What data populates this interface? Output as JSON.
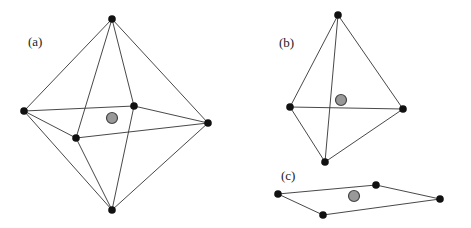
{
  "figure": {
    "panels": [
      {
        "label": "(a)",
        "shape": "octahedron",
        "label_pos": [
          28,
          46
        ],
        "vertices": [
          [
            112,
            19
          ],
          [
            24,
            111
          ],
          [
            134,
            106
          ],
          [
            208,
            123
          ],
          [
            76,
            138
          ],
          [
            112,
            210
          ]
        ],
        "edges": [
          [
            0,
            1
          ],
          [
            0,
            2
          ],
          [
            0,
            3
          ],
          [
            0,
            4
          ],
          [
            5,
            1
          ],
          [
            5,
            2
          ],
          [
            5,
            3
          ],
          [
            5,
            4
          ],
          [
            1,
            2
          ],
          [
            2,
            3
          ],
          [
            3,
            4
          ],
          [
            4,
            1
          ]
        ],
        "center": [
          112,
          118
        ]
      },
      {
        "label": "(b)",
        "shape": "tetrahedron",
        "label_pos": [
          279,
          47
        ],
        "vertices": [
          [
            338,
            15
          ],
          [
            290,
            107
          ],
          [
            403,
            109
          ],
          [
            325,
            162
          ]
        ],
        "edges": [
          [
            0,
            1
          ],
          [
            0,
            2
          ],
          [
            0,
            3
          ],
          [
            1,
            2
          ],
          [
            1,
            3
          ],
          [
            2,
            3
          ]
        ],
        "center": [
          341,
          100
        ]
      },
      {
        "label": "(c)",
        "shape": "square-planar",
        "label_pos": [
          281,
          180
        ],
        "vertices": [
          [
            278,
            194
          ],
          [
            376,
            185
          ],
          [
            440,
            199
          ],
          [
            323,
            215
          ]
        ],
        "edges": [
          [
            0,
            1
          ],
          [
            1,
            2
          ],
          [
            2,
            3
          ],
          [
            3,
            0
          ]
        ],
        "center": [
          354,
          196
        ]
      }
    ],
    "colors": {
      "vertex": "#111111",
      "center_fill": "#999999",
      "center_stroke": "#444444",
      "edge": "#333333"
    }
  }
}
